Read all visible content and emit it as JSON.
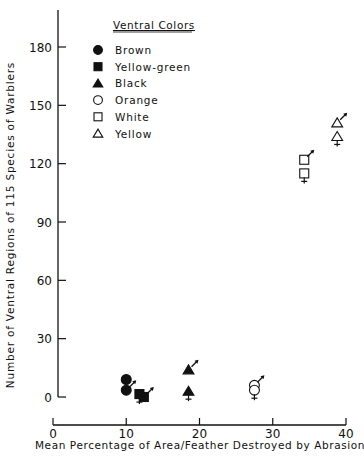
{
  "chart_data": {
    "type": "scatter",
    "title": "",
    "xlabel": "Mean Percentage of Area/Feather Destroyed by Abrasion",
    "ylabel": "Number of Ventral Regions of 115 Species of Warblers",
    "xlim": [
      0,
      40
    ],
    "ylim": [
      0,
      190
    ],
    "xticks": [
      0,
      10,
      20,
      30,
      40
    ],
    "yticks": [
      0,
      30,
      60,
      90,
      120,
      150,
      180
    ],
    "grid": false,
    "legend_title": "Ventral Colors",
    "legend_position": "upper-left",
    "series": [
      {
        "name": "Brown",
        "marker": "filled-circle",
        "points": [
          {
            "x": 10,
            "y": 9,
            "sex": "female"
          },
          {
            "x": 10,
            "y": 3.5,
            "sex": "male"
          }
        ]
      },
      {
        "name": "Yellow-green",
        "marker": "filled-square",
        "points": [
          {
            "x": 11.8,
            "y": 1.5,
            "sex": "female"
          },
          {
            "x": 12.4,
            "y": 0,
            "sex": "male"
          }
        ]
      },
      {
        "name": "Black",
        "marker": "filled-triangle",
        "points": [
          {
            "x": 18.5,
            "y": 14,
            "sex": "male"
          },
          {
            "x": 18.5,
            "y": 3,
            "sex": "female"
          }
        ]
      },
      {
        "name": "Orange",
        "marker": "open-circle",
        "points": [
          {
            "x": 27.5,
            "y": 6,
            "sex": "male"
          },
          {
            "x": 27.5,
            "y": 3.5,
            "sex": "female"
          }
        ]
      },
      {
        "name": "White",
        "marker": "open-square",
        "points": [
          {
            "x": 34.3,
            "y": 122,
            "sex": "male"
          },
          {
            "x": 34.3,
            "y": 115,
            "sex": "female"
          }
        ]
      },
      {
        "name": "Yellow",
        "marker": "open-triangle",
        "points": [
          {
            "x": 38.8,
            "y": 141,
            "sex": "male"
          },
          {
            "x": 38.8,
            "y": 134,
            "sex": "female"
          }
        ]
      }
    ]
  },
  "legend": {
    "title": "Ventral Colors",
    "items": [
      {
        "label": "Brown",
        "marker": "filled-circle"
      },
      {
        "label": "Yellow-green",
        "marker": "filled-square"
      },
      {
        "label": "Black",
        "marker": "filled-triangle"
      },
      {
        "label": "Orange",
        "marker": "open-circle"
      },
      {
        "label": "White",
        "marker": "open-square"
      },
      {
        "label": "Yellow",
        "marker": "open-triangle"
      }
    ]
  },
  "axes": {
    "x_label": "Mean Percentage of Area/Feather Destroyed by Abrasion",
    "y_label": "Number of Ventral Regions of 115 Species of Warblers",
    "x_ticks": [
      "0",
      "10",
      "20",
      "30",
      "40"
    ],
    "y_ticks": [
      "0",
      "30",
      "60",
      "90",
      "120",
      "150",
      "180"
    ]
  }
}
